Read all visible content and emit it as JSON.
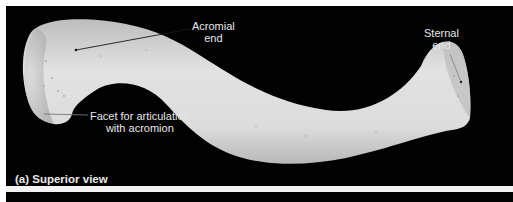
{
  "figure": {
    "caption": "(a) Superior view",
    "labels": {
      "acromial_end": {
        "line1": "Acromial",
        "line2": "end"
      },
      "sternal_end": {
        "line1": "Sternal",
        "line2": "end"
      },
      "facet": {
        "line1": "Facet for articulation",
        "line2": "with acromion"
      }
    },
    "colors": {
      "background": "#020202",
      "bone": "#d9d9d9",
      "label_text": "#e6e6e6",
      "page": "#ffffff"
    }
  }
}
